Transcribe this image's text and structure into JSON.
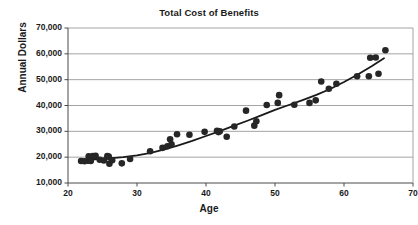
{
  "chart_data": {
    "type": "scatter",
    "title": "Total Cost of Benefits",
    "xlabel": "Age",
    "ylabel": "Annual Dollars",
    "xlim": [
      20,
      70
    ],
    "ylim": [
      10000,
      70000
    ],
    "xticks": [
      20,
      30,
      40,
      50,
      60,
      70
    ],
    "xtick_labels": [
      "20",
      "30",
      "40",
      "50",
      "60",
      "70"
    ],
    "yticks": [
      10000,
      20000,
      30000,
      40000,
      50000,
      60000,
      70000
    ],
    "ytick_labels": [
      "10,000",
      "20,000",
      "30,000",
      "40,000",
      "50,000",
      "60,000",
      "70,000"
    ],
    "grid": "horizontal",
    "legend": "none",
    "marker_color": "#262626",
    "marker_size": 4.4,
    "trendline": {
      "label": "fitted curve",
      "color": "#1a1a1a",
      "width": 1.8,
      "points": [
        [
          22.0,
          18900
        ],
        [
          24.0,
          19150
        ],
        [
          26.0,
          19500
        ],
        [
          28.0,
          20000
        ],
        [
          30.0,
          20700
        ],
        [
          32.0,
          21700
        ],
        [
          34.0,
          23000
        ],
        [
          36.0,
          24600
        ],
        [
          38.0,
          26300
        ],
        [
          40.0,
          28200
        ],
        [
          42.0,
          30100
        ],
        [
          44.0,
          32100
        ],
        [
          46.0,
          34100
        ],
        [
          48.0,
          36200
        ],
        [
          50.0,
          38300
        ],
        [
          52.0,
          40200
        ],
        [
          54.0,
          42100
        ],
        [
          56.0,
          44100
        ],
        [
          58.0,
          46400
        ],
        [
          60.0,
          49100
        ],
        [
          62.0,
          52000
        ],
        [
          64.0,
          55200
        ],
        [
          65.8,
          58300
        ]
      ]
    },
    "series": [
      {
        "name": "Employees",
        "color": "#262626",
        "points": [
          [
            21.9,
            18500
          ],
          [
            22.4,
            18400
          ],
          [
            22.9,
            18600
          ],
          [
            23.0,
            20300
          ],
          [
            23.3,
            18500
          ],
          [
            23.6,
            20400
          ],
          [
            24.0,
            20500
          ],
          [
            24.6,
            19000
          ],
          [
            25.2,
            18700
          ],
          [
            25.7,
            20400
          ],
          [
            25.9,
            20200
          ],
          [
            26.0,
            17500
          ],
          [
            26.4,
            18800
          ],
          [
            27.8,
            17600
          ],
          [
            29.0,
            19300
          ],
          [
            31.9,
            22300
          ],
          [
            33.7,
            23600
          ],
          [
            34.4,
            24200
          ],
          [
            34.8,
            26900
          ],
          [
            35.0,
            25000
          ],
          [
            35.8,
            28900
          ],
          [
            37.6,
            28700
          ],
          [
            39.8,
            29800
          ],
          [
            41.6,
            30200
          ],
          [
            41.8,
            29700
          ],
          [
            42.0,
            30000
          ],
          [
            43.0,
            27900
          ],
          [
            44.1,
            31900
          ],
          [
            45.8,
            38000
          ],
          [
            47.0,
            32200
          ],
          [
            47.3,
            33900
          ],
          [
            48.8,
            40200
          ],
          [
            50.4,
            41000
          ],
          [
            50.6,
            44000
          ],
          [
            52.8,
            40300
          ],
          [
            55.0,
            41000
          ],
          [
            55.9,
            42000
          ],
          [
            56.7,
            49300
          ],
          [
            57.8,
            46500
          ],
          [
            58.9,
            48400
          ],
          [
            61.9,
            51300
          ],
          [
            63.6,
            51300
          ],
          [
            63.8,
            58500
          ],
          [
            64.6,
            58600
          ],
          [
            65.0,
            52300
          ],
          [
            66.0,
            61400
          ]
        ]
      }
    ]
  }
}
